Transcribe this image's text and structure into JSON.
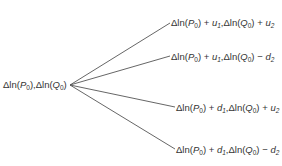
{
  "diagram": {
    "type": "tree",
    "root": {
      "label": "Δln(P0),Δln(Q0)"
    },
    "branches": [
      {
        "label": "Δln(P0) + u1,Δln(Q0) + u2",
        "p_shift": "u1",
        "q_op": "+",
        "q_shift": "u2"
      },
      {
        "label": "Δln(P0) + u1,Δln(Q0) − d2",
        "p_shift": "u1",
        "q_op": "−",
        "q_shift": "d2"
      },
      {
        "label": "Δln(P0) + d1,Δln(Q0) + u2",
        "p_shift": "d1",
        "q_op": "+",
        "q_shift": "u2"
      },
      {
        "label": "Δln(P0) + d1,Δln(Q0) − d2",
        "p_shift": "d1",
        "q_op": "−",
        "q_shift": "d2"
      }
    ],
    "colors": {
      "line": "#555555",
      "text": "#333333",
      "background": "#ffffff"
    }
  }
}
